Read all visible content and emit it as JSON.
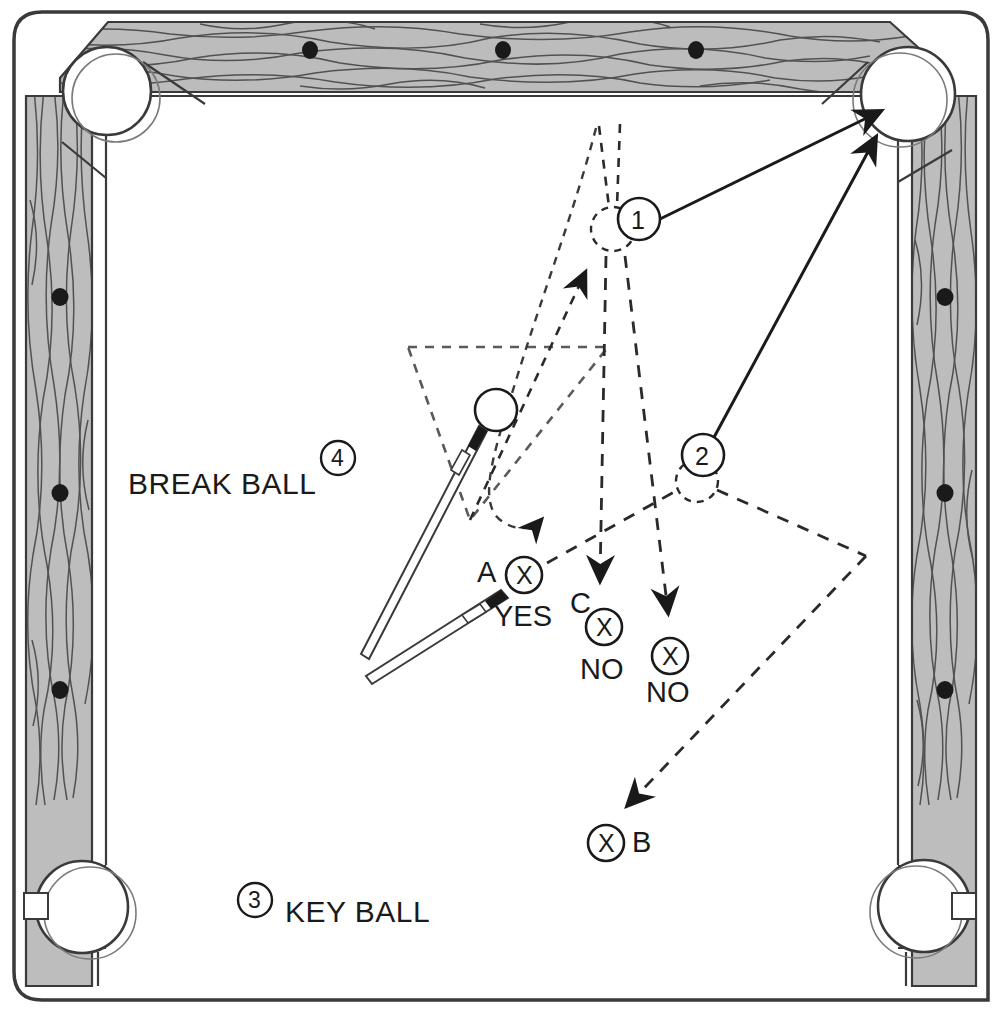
{
  "diagram": {
    "type": "billiards-table-layout",
    "table": {
      "rail_color": "#bdbdbd",
      "rail_outline": "#3a3a3a",
      "cloth_color": "#ffffff",
      "line_color": "#1a1a1a",
      "diamond_color": "#1a1a1a",
      "pockets": [
        {
          "name": "top-left-corner-pocket",
          "x": 107,
          "y": 91,
          "r": 44
        },
        {
          "name": "top-right-corner-pocket",
          "x": 908,
          "y": 94,
          "r": 47
        },
        {
          "name": "bottom-left-side-pocket",
          "x": 82,
          "y": 907,
          "r": 46
        },
        {
          "name": "bottom-right-side-pocket",
          "x": 924,
          "y": 906,
          "r": 46
        }
      ],
      "diamonds_top": [
        {
          "x": 310,
          "y": 50
        },
        {
          "x": 503,
          "y": 50
        },
        {
          "x": 696,
          "y": 50
        }
      ],
      "diamonds_left": [
        {
          "x": 60,
          "y": 297
        },
        {
          "x": 60,
          "y": 493
        },
        {
          "x": 60,
          "y": 690
        }
      ],
      "diamonds_right": [
        {
          "x": 945,
          "y": 297
        },
        {
          "x": 945,
          "y": 493
        },
        {
          "x": 945,
          "y": 690
        }
      ]
    },
    "balls": [
      {
        "name": "break-ball",
        "style": "solid",
        "x": 496,
        "y": 410,
        "r": 21
      },
      {
        "name": "ghost-ball-1",
        "style": "dashed",
        "x": 613,
        "y": 229,
        "r": 22,
        "badge": "1",
        "badge_x": 639,
        "badge_y": 219
      },
      {
        "name": "ghost-ball-2",
        "style": "dashed",
        "x": 697,
        "y": 481,
        "r": 21,
        "badge": "2",
        "badge_x": 703,
        "badge_y": 455
      }
    ],
    "markers": [
      {
        "name": "marker-a",
        "glyph": "X",
        "x": 524,
        "y": 575,
        "label_left": "A",
        "label_below": "YES"
      },
      {
        "name": "marker-c",
        "glyph": "X",
        "x": 604,
        "y": 627,
        "label_left": "C",
        "label_below": "NO"
      },
      {
        "name": "marker-no-right",
        "glyph": "X",
        "x": 670,
        "y": 656,
        "label_below": "NO"
      },
      {
        "name": "marker-b",
        "glyph": "X",
        "x": 606,
        "y": 843,
        "label_right": "B"
      }
    ],
    "labels": {
      "break_ball": "BREAK BALL",
      "break_ball_badge": "4",
      "key_ball": "KEY BALL",
      "key_ball_badge": "3",
      "marker_a": "A",
      "marker_a_answer": "YES",
      "marker_c": "C",
      "marker_c_answer": "NO",
      "marker_no_right": "NO",
      "marker_b": "B"
    },
    "legend_numbers": [
      {
        "number": "1",
        "meaning": "first object ball position"
      },
      {
        "number": "2",
        "meaning": "second object ball position"
      },
      {
        "number": "3",
        "meaning": "KEY BALL"
      },
      {
        "number": "4",
        "meaning": "BREAK BALL"
      }
    ],
    "cue_sticks": [
      {
        "name": "cue-stick-upper",
        "tip_x": 487,
        "tip_y": 431,
        "butt_x": 365,
        "butt_y": 663
      },
      {
        "name": "cue-stick-lower",
        "tip_x": 508,
        "tip_y": 598,
        "butt_x": 365,
        "butt_y": 690
      }
    ],
    "shot_arrows": [
      {
        "name": "solid-arrow-ball1-to-pocket",
        "from": "ghost-ball-1",
        "to": "top-right-corner-pocket"
      },
      {
        "name": "solid-arrow-ball2-to-pocket",
        "from": "ghost-ball-2",
        "to": "top-right-corner-pocket"
      }
    ],
    "dashed_paths": [
      {
        "name": "path-a-yes",
        "note": "cue ball route to A"
      },
      {
        "name": "path-c-no",
        "note": "cue ball route to C"
      },
      {
        "name": "path-no-right",
        "note": "cue ball route to right NO"
      },
      {
        "name": "path-b",
        "note": "cue ball route off rail to B"
      },
      {
        "name": "rack-triangle",
        "note": "dashed rack outline"
      }
    ]
  }
}
